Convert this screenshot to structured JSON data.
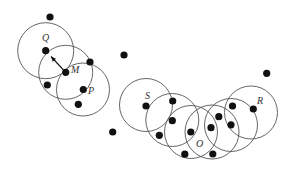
{
  "diagram": {
    "title": "",
    "labels": [
      {
        "id": "Q",
        "text": "Q",
        "x": 42,
        "y": 41
      },
      {
        "id": "M",
        "text": "M",
        "x": 71,
        "y": 73
      },
      {
        "id": "P",
        "text": "P",
        "x": 88,
        "y": 94
      },
      {
        "id": "S",
        "text": "S",
        "x": 145,
        "y": 99
      },
      {
        "id": "O",
        "text": "O",
        "x": 196,
        "y": 147
      },
      {
        "id": "R",
        "text": "R",
        "x": 257,
        "y": 104
      }
    ],
    "circles": [
      {
        "center": "Q",
        "cx": 45.7,
        "cy": 50.7,
        "r": 28
      },
      {
        "center": "M",
        "cx": 65.7,
        "cy": 72.3,
        "r": 27
      },
      {
        "center": "P",
        "cx": 83,
        "cy": 89.5,
        "r": 26.5
      },
      {
        "center": "S",
        "cx": 146,
        "cy": 105,
        "r": 26.5
      },
      {
        "center": "c2",
        "cx": 172.3,
        "cy": 120,
        "r": 26.5
      },
      {
        "center": "c3",
        "cx": 191,
        "cy": 132,
        "r": 26.5
      },
      {
        "center": "O",
        "cx": 212,
        "cy": 132,
        "r": 27
      },
      {
        "center": "c5",
        "cx": 231,
        "cy": 125,
        "r": 26.5
      },
      {
        "center": "R",
        "cx": 251,
        "cy": 112.5,
        "r": 26.5
      }
    ],
    "points": [
      {
        "x": 50,
        "y": 17
      },
      {
        "x": 45.7,
        "y": 50.7
      },
      {
        "x": 65.7,
        "y": 72.3
      },
      {
        "x": 90,
        "y": 62
      },
      {
        "x": 47.3,
        "y": 85
      },
      {
        "x": 83.3,
        "y": 89.5
      },
      {
        "x": 78.3,
        "y": 104.3
      },
      {
        "x": 124,
        "y": 55
      },
      {
        "x": 112.7,
        "y": 132
      },
      {
        "x": 146,
        "y": 106
      },
      {
        "x": 172.7,
        "y": 101
      },
      {
        "x": 172.3,
        "y": 120.7
      },
      {
        "x": 159.3,
        "y": 135.3
      },
      {
        "x": 190.8,
        "y": 132
      },
      {
        "x": 184.8,
        "y": 154.2
      },
      {
        "x": 211,
        "y": 127.7
      },
      {
        "x": 212.8,
        "y": 154
      },
      {
        "x": 218.8,
        "y": 116.7
      },
      {
        "x": 232.5,
        "y": 106
      },
      {
        "x": 231,
        "y": 124.8
      },
      {
        "x": 253.3,
        "y": 109
      },
      {
        "x": 266.7,
        "y": 73.3
      }
    ],
    "arrow": {
      "from": "M",
      "to": "Q",
      "x1": 65.7,
      "y1": 72.3,
      "x2": 51,
      "y2": 56.5
    }
  }
}
